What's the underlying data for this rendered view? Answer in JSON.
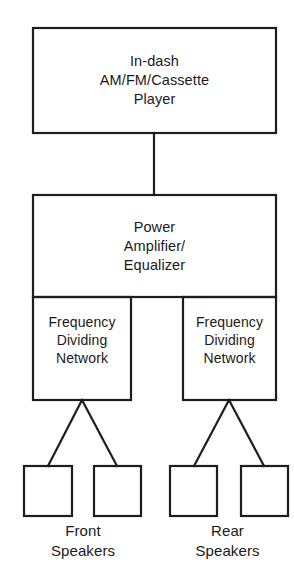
{
  "diagram": {
    "stroke_color": "#1d1d1d",
    "background_color": "#ffffff",
    "nodes": {
      "head_unit": {
        "label": "In-dash\nAM/FM/Cassette\nPlayer",
        "line1": "In-dash",
        "line2": "AM/FM/Cassette",
        "line3": "Player"
      },
      "amplifier": {
        "label": "Power\nAmplifier/\nEqualizer",
        "line1": "Power",
        "line2": "Amplifier/",
        "line3": "Equalizer"
      },
      "fdn_left": {
        "label": "Frequency\nDividing\nNetwork",
        "line1": "Frequency",
        "line2": "Dividing",
        "line3": "Network"
      },
      "fdn_right": {
        "label": "Frequency\nDividing\nNetwork",
        "line1": "Frequency",
        "line2": "Dividing",
        "line3": "Network"
      },
      "speaker_front_left": {
        "label": ""
      },
      "speaker_front_right": {
        "label": ""
      },
      "speaker_rear_left": {
        "label": ""
      },
      "speaker_rear_right": {
        "label": ""
      }
    },
    "captions": {
      "front_speakers": "Front\nSpeakers",
      "rear_speakers": "Rear\nSpeakers"
    },
    "connections": [
      {
        "from": "head_unit",
        "to": "amplifier",
        "type": "vertical-line"
      },
      {
        "from": "fdn_left",
        "to": "speaker_front_left",
        "type": "diagonal"
      },
      {
        "from": "fdn_left",
        "to": "speaker_front_right",
        "type": "diagonal"
      },
      {
        "from": "fdn_right",
        "to": "speaker_rear_left",
        "type": "diagonal"
      },
      {
        "from": "fdn_right",
        "to": "speaker_rear_right",
        "type": "diagonal"
      }
    ]
  }
}
